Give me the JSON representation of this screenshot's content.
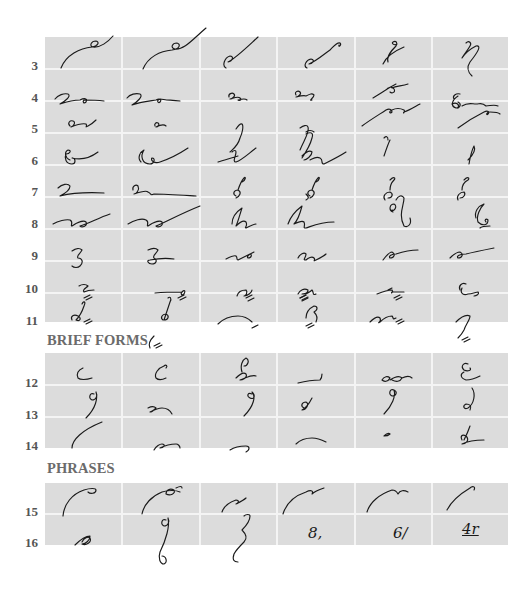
{
  "sections": [
    {
      "title": "",
      "rows": [
        "3",
        "4",
        "5",
        "6",
        "7",
        "8",
        "9",
        "10",
        "11"
      ]
    },
    {
      "title": "BRIEF FORMS",
      "rows": [
        "12",
        "13",
        "14"
      ]
    },
    {
      "title": "PHRASES",
      "rows": [
        "15",
        "16"
      ]
    }
  ],
  "columns": 6,
  "phrase_numerals": {
    "row16_col4": "8,",
    "row16_col5": "6/",
    "row16_col6": "4r"
  },
  "colors": {
    "cell_fill": "#dcdcdc",
    "grid_lines": "#f4f4f4",
    "ink": "#1a1a1a",
    "row_number": "#555555",
    "section_title": "#6b6b6b"
  },
  "icons": {
    "shorthand_glyph": "handwritten Gregg shorthand outline"
  }
}
